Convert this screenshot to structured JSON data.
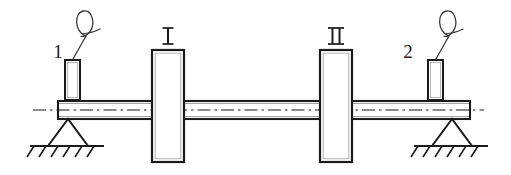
{
  "figure": {
    "type": "engineering-schematic",
    "background_color": "#ffffff",
    "line_color": "#1b1b1b",
    "width": 511,
    "height": 175
  },
  "shaft": {
    "name": "rotor-shaft",
    "left_x": 58,
    "right_x": 470,
    "top_y": 101,
    "bottom_y": 119,
    "centerline_y": 110,
    "centerline_left_x": 33,
    "centerline_right_x": 484,
    "centerline_style": "dash-dot"
  },
  "discs": [
    {
      "id": "disc-1",
      "label": "I",
      "label_x": 168,
      "label_y": 42,
      "x": 152,
      "y": 50,
      "width": 32,
      "height": 112
    },
    {
      "id": "disc-2",
      "label": "II",
      "label_x": 336,
      "label_y": 42,
      "x": 320,
      "y": 50,
      "width": 32,
      "height": 112
    }
  ],
  "probes": [
    {
      "id": "probe-1",
      "callout_label": "1",
      "label_x": 58,
      "label_y": 58,
      "box_x": 65,
      "box_y": 60,
      "box_width": 15,
      "box_height": 40,
      "balloon_cx": 85,
      "balloon_cy": 25,
      "balloon_rx": 9,
      "balloon_ry": 14
    },
    {
      "id": "probe-2",
      "callout_label": "2",
      "label_x": 408,
      "label_y": 58,
      "box_x": 428,
      "box_y": 60,
      "box_width": 15,
      "box_height": 40,
      "balloon_cx": 448,
      "balloon_cy": 25,
      "balloon_rx": 9,
      "balloon_ry": 14
    }
  ],
  "supports": [
    {
      "id": "support-left",
      "type": "pinned-triangle",
      "apex_x": 68,
      "apex_y": 119,
      "base_left_x": 48,
      "base_right_x": 88,
      "base_y": 146,
      "ground_left_x": 30,
      "ground_right_x": 104,
      "hatch_count": 6
    },
    {
      "id": "support-right",
      "type": "pinned-triangle",
      "apex_x": 452,
      "apex_y": 119,
      "base_left_x": 432,
      "base_right_x": 472,
      "base_y": 146,
      "ground_left_x": 414,
      "ground_right_x": 488,
      "hatch_count": 6
    }
  ]
}
